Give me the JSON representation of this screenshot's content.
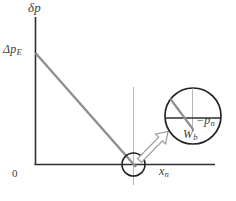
{
  "figure": {
    "colors": {
      "background": "#ffffff",
      "axis": "#2e2e2e",
      "sloped_line": "#8f8f8c",
      "thin_reference_line": "#b6b6b6",
      "circle_outline": "#222222",
      "arrow_outline": "#9a9a98",
      "text": "#3d3d3d"
    },
    "labels": {
      "y_axis": "δp",
      "y_intercept": "Δp",
      "y_intercept_sub": "E",
      "origin": "0",
      "x_axis": "x",
      "x_axis_sub": "n",
      "mag_depth": "−p",
      "mag_depth_sub": "n",
      "mag_point": "W",
      "mag_point_sub": "b"
    }
  }
}
